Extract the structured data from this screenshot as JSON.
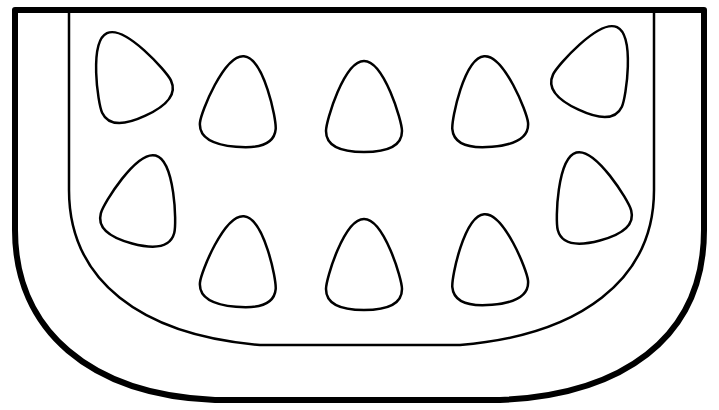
{
  "image": {
    "subject": "watermelon slice coloring page",
    "stroke_color": "#000000",
    "fill_color": "#ffffff",
    "seed_count": 11
  }
}
